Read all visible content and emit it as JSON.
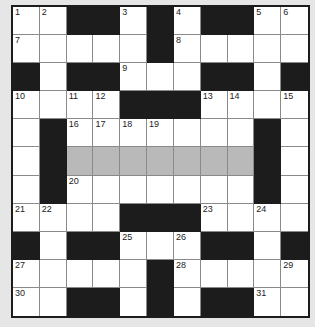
{
  "puzzle": {
    "rows": 11,
    "cols": 11,
    "colors": {
      "background": "#e6e6e6",
      "white": "#ffffff",
      "black": "#1c1c1c",
      "shaded": "#b9b9b9",
      "gridline": "#8a8a8a"
    },
    "layout": [
      "WWBBWBWBBWW",
      "WWWWWBWWWWW",
      "BWBBWWWBBWB",
      "WWWWBBBWWWW",
      "WBWWWWWWWBW",
      "WBGGGGGGGBW",
      "WBWWWWWWWBW",
      "WWWWBBBWWWW",
      "BWBBWWWBBWB",
      "WWWWWBWWWWW",
      "WWBBWBWBBWW"
    ],
    "numbers": [
      {
        "r": 0,
        "c": 0,
        "n": "1"
      },
      {
        "r": 0,
        "c": 1,
        "n": "2"
      },
      {
        "r": 0,
        "c": 4,
        "n": "3"
      },
      {
        "r": 0,
        "c": 6,
        "n": "4"
      },
      {
        "r": 0,
        "c": 9,
        "n": "5"
      },
      {
        "r": 0,
        "c": 10,
        "n": "6"
      },
      {
        "r": 1,
        "c": 0,
        "n": "7"
      },
      {
        "r": 1,
        "c": 6,
        "n": "8"
      },
      {
        "r": 2,
        "c": 4,
        "n": "9"
      },
      {
        "r": 3,
        "c": 0,
        "n": "10"
      },
      {
        "r": 3,
        "c": 2,
        "n": "11"
      },
      {
        "r": 3,
        "c": 3,
        "n": "12"
      },
      {
        "r": 3,
        "c": 7,
        "n": "13"
      },
      {
        "r": 3,
        "c": 8,
        "n": "14"
      },
      {
        "r": 3,
        "c": 10,
        "n": "15"
      },
      {
        "r": 4,
        "c": 2,
        "n": "16"
      },
      {
        "r": 4,
        "c": 3,
        "n": "17"
      },
      {
        "r": 4,
        "c": 4,
        "n": "18"
      },
      {
        "r": 4,
        "c": 5,
        "n": "19"
      },
      {
        "r": 6,
        "c": 2,
        "n": "20"
      },
      {
        "r": 7,
        "c": 0,
        "n": "21"
      },
      {
        "r": 7,
        "c": 1,
        "n": "22"
      },
      {
        "r": 7,
        "c": 7,
        "n": "23"
      },
      {
        "r": 7,
        "c": 9,
        "n": "24"
      },
      {
        "r": 8,
        "c": 4,
        "n": "25"
      },
      {
        "r": 8,
        "c": 6,
        "n": "26"
      },
      {
        "r": 9,
        "c": 0,
        "n": "27"
      },
      {
        "r": 9,
        "c": 6,
        "n": "28"
      },
      {
        "r": 9,
        "c": 10,
        "n": "29"
      },
      {
        "r": 10,
        "c": 0,
        "n": "30"
      },
      {
        "r": 10,
        "c": 9,
        "n": "31"
      }
    ]
  }
}
